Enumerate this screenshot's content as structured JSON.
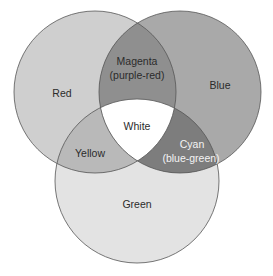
{
  "diagram": {
    "type": "venn",
    "circles": [
      {
        "id": "red",
        "label": "Red",
        "cx": 95,
        "cy": 92,
        "r": 81,
        "fill": "#cfcfcf"
      },
      {
        "id": "blue",
        "label": "Blue",
        "cx": 180,
        "cy": 92,
        "r": 81,
        "fill": "#a9a9a9"
      },
      {
        "id": "green",
        "label": "Green",
        "cx": 137,
        "cy": 181,
        "r": 82,
        "fill": "#e3e3e3"
      }
    ],
    "regions": {
      "red": {
        "label": "Red"
      },
      "blue": {
        "label": "Blue"
      },
      "green": {
        "label": "Green"
      },
      "magenta": {
        "line1": "Magenta",
        "line2": "(purple-red)",
        "sets": [
          "red",
          "blue"
        ],
        "fill": "#8f8f8f"
      },
      "yellow": {
        "label": "Yellow",
        "sets": [
          "red",
          "green"
        ],
        "fill": "#b9b9b9"
      },
      "cyan": {
        "line1": "Cyan",
        "line2": "(blue-green)",
        "sets": [
          "blue",
          "green"
        ],
        "fill": "#7d7d7d"
      },
      "white": {
        "label": "White",
        "sets": [
          "red",
          "blue",
          "green"
        ],
        "fill": "#ffffff"
      }
    },
    "colors": {
      "outline": "#555555",
      "text": "#2b2b2b",
      "text_light": "#f4f4f4",
      "background": "#ffffff"
    }
  }
}
